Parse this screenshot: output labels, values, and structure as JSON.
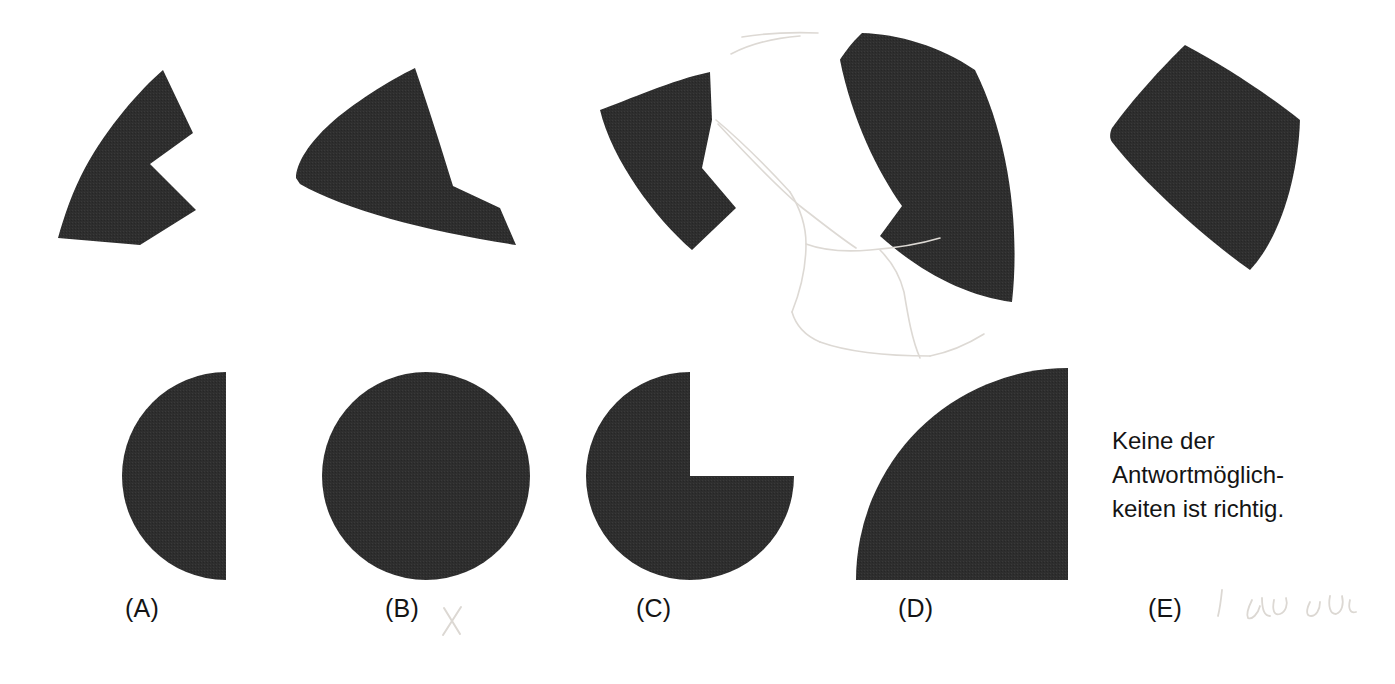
{
  "page": {
    "width": 1395,
    "height": 684,
    "background_color": "#ffffff",
    "figure_fill_color": "#2e2e2e",
    "pencil_mark_color": "#d8d6d2",
    "kind": "figure-assembly-multiple-choice-item"
  },
  "prompt_pieces": {
    "description": "Four dark puzzle fragments to be mentally assembled",
    "count": 4,
    "items": [
      {
        "id": "piece-1",
        "label": "fragment-1"
      },
      {
        "id": "piece-2",
        "label": "fragment-2"
      },
      {
        "id": "piece-3",
        "label": "fragment-3"
      },
      {
        "id": "piece-4",
        "label": "fragment-4"
      }
    ]
  },
  "options": [
    {
      "key": "A",
      "label": "(A)",
      "shape": "half-circle-left"
    },
    {
      "key": "B",
      "label": "(B)",
      "shape": "full-circle"
    },
    {
      "key": "C",
      "label": "(C)",
      "shape": "three-quarter-circle"
    },
    {
      "key": "D",
      "label": "(D)",
      "shape": "quarter-circle"
    },
    {
      "key": "E",
      "label": "(E)",
      "shape": "text"
    }
  ],
  "option_e_text": "Keine der\nAntwortmöglich-\nkeiten ist richtig.",
  "annotations": {
    "x_mark_near_b": "X",
    "handwriting_near_e": "handwritten pencil scribble"
  }
}
